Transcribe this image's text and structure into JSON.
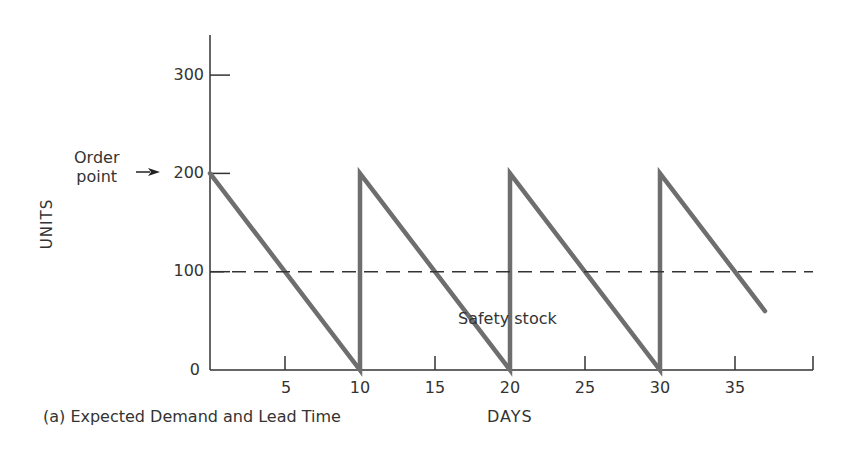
{
  "chart_data": {
    "type": "line",
    "title": "",
    "caption": "(a) Expected Demand and Lead Time",
    "xlabel": "DAYS",
    "ylabel": "UNITS",
    "xlim": [
      0,
      40
    ],
    "ylim": [
      0,
      340
    ],
    "x_ticks": [
      5,
      10,
      15,
      20,
      25,
      30,
      35
    ],
    "y_ticks": [
      0,
      100,
      200,
      300
    ],
    "grid": false,
    "legend": null,
    "series": [
      {
        "name": "Inventory level",
        "color": "#6e6e6e",
        "style": "solid-thick",
        "x": [
          0,
          10,
          10,
          20,
          20,
          30,
          30,
          37
        ],
        "y": [
          200,
          0,
          200,
          0,
          200,
          0,
          200,
          60
        ]
      },
      {
        "name": "Safety stock",
        "color": "#333333",
        "style": "dashed",
        "x": [
          0,
          40
        ],
        "y": [
          100,
          100
        ]
      }
    ],
    "annotations": [
      {
        "text": "Order point",
        "arrow_to": {
          "x": 0,
          "y": 200
        }
      },
      {
        "text": "Safety stock",
        "x": 20,
        "y": 50
      }
    ]
  },
  "labels": {
    "y_ticks": [
      "0",
      "100",
      "200",
      "300"
    ],
    "x_ticks": [
      "5",
      "10",
      "15",
      "20",
      "25",
      "30",
      "35"
    ],
    "ylabel": "UNITS",
    "xlabel": "DAYS",
    "order_point_line1": "Order",
    "order_point_line2": "point",
    "safety_stock": "Safety stock",
    "caption": "(a) Expected Demand and Lead Time"
  }
}
